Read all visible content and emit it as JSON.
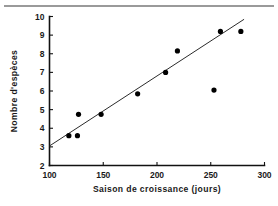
{
  "figure": {
    "top_rule_color": "#9a9a9a",
    "background": "#ffffff"
  },
  "chart_data": {
    "type": "scatter",
    "title": "",
    "subtitle": "",
    "xlabel": "Saison de croissance (jours)",
    "ylabel": "Nombre d'espèces",
    "xlim": [
      100,
      300
    ],
    "ylim": [
      2,
      10
    ],
    "xticks": [
      100,
      150,
      200,
      250,
      300
    ],
    "xticklabels": [
      "100",
      "150",
      "200",
      "250",
      "300"
    ],
    "yticks": [
      2,
      3,
      4,
      5,
      6,
      7,
      8,
      9,
      10
    ],
    "yticklabels": [
      "2",
      "3",
      "4",
      "5",
      "6",
      "7",
      "8",
      "9",
      "10"
    ],
    "grid": false,
    "legend": null,
    "marker": "filled-circle",
    "marker_color": "#000000",
    "points": [
      {
        "x": 118,
        "y": 3.6
      },
      {
        "x": 126,
        "y": 3.6
      },
      {
        "x": 127,
        "y": 4.75
      },
      {
        "x": 148,
        "y": 4.75
      },
      {
        "x": 182,
        "y": 5.85
      },
      {
        "x": 208,
        "y": 7.0
      },
      {
        "x": 219,
        "y": 8.15
      },
      {
        "x": 253,
        "y": 6.05
      },
      {
        "x": 259,
        "y": 9.2
      },
      {
        "x": 278,
        "y": 9.2
      }
    ],
    "trendline": {
      "type": "linear-fit",
      "color": "#2b2b2b",
      "x_start": 100,
      "y_start": 3.05,
      "x_end": 281,
      "y_end": 9.85
    },
    "annotations": []
  }
}
